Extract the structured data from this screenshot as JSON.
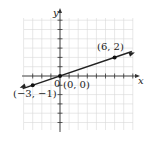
{
  "chart_data": {
    "type": "line",
    "title": "",
    "xlabel": "x",
    "ylabel": "y",
    "xlim": [
      -4,
      8
    ],
    "ylim": [
      -6,
      6
    ],
    "grid": true,
    "origin_label": "0",
    "series": [
      {
        "name": "line through origin",
        "x": [
          -3,
          0,
          6
        ],
        "y": [
          -1,
          0,
          2
        ],
        "arrows": "both"
      }
    ],
    "annotations": [
      {
        "text": "(-3, -1)",
        "x": -3,
        "y": -1
      },
      {
        "text": "(0, 0)",
        "x": 0,
        "y": 0
      },
      {
        "text": "(6, 2)",
        "x": 6,
        "y": 2
      }
    ]
  },
  "labels": {
    "x_axis": "x",
    "y_axis": "y",
    "origin": "0",
    "point_a": "(−3, −1)",
    "point_b": "(0, 0)",
    "point_c": "(6, 2)"
  },
  "colors": {
    "grid": "#d9d9d9",
    "axis": "#333333",
    "line": "#222222",
    "text": "#222222"
  }
}
